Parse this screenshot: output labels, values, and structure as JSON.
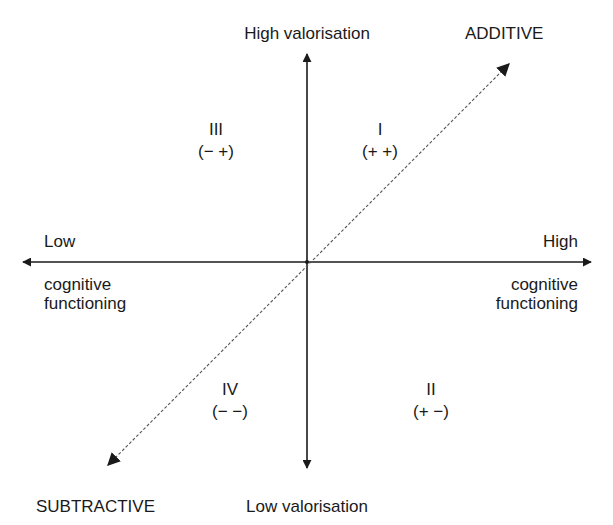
{
  "diagram": {
    "type": "quadrant-diagram",
    "axes": {
      "vertical": {
        "top_label": "High valorisation",
        "bottom_label": "Low valorisation"
      },
      "horizontal": {
        "left_label_top": "Low",
        "left_label_bottom_1": "cognitive",
        "left_label_bottom_2": "functioning",
        "right_label_top": "High",
        "right_label_bottom_1": "cognitive",
        "right_label_bottom_2": "functioning"
      },
      "diagonal": {
        "top_right_label": "ADDITIVE",
        "bottom_left_label": "SUBTRACTIVE",
        "style": "dashed"
      }
    },
    "quadrants": [
      {
        "id": "I",
        "numeral": "I",
        "signs": "(+ +)",
        "position": "top-right"
      },
      {
        "id": "II",
        "numeral": "II",
        "signs": "(+ −)",
        "position": "bottom-right"
      },
      {
        "id": "III",
        "numeral": "III",
        "signs": "(− +)",
        "position": "top-left"
      },
      {
        "id": "IV",
        "numeral": "IV",
        "signs": "(− −)",
        "position": "bottom-left"
      }
    ],
    "colors": {
      "line": "#1a1a1a",
      "dashed_line": "#555555",
      "text": "#1a1a1a",
      "background": "#ffffff"
    }
  }
}
